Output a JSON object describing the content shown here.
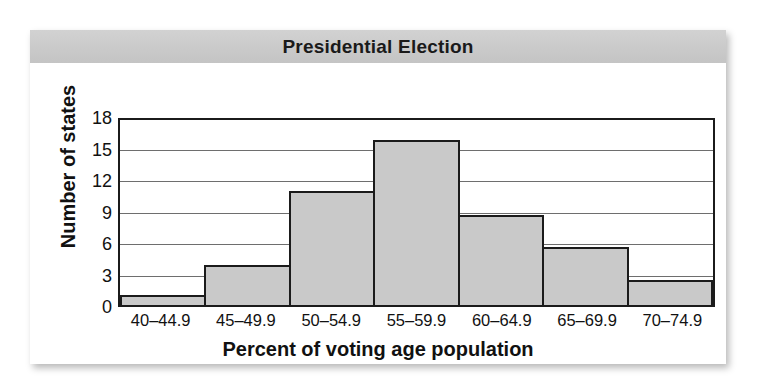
{
  "figure": {
    "title": "Presidential Election",
    "background_color": "#ffffff",
    "title_band_color": "#cacaca",
    "bar_fill_color": "#c9c9c9",
    "bar_border_color": "#1b1b1b",
    "axis_color": "#1b1b1b",
    "gridline_color": "#6e6e6e"
  },
  "chart_data": {
    "type": "bar",
    "title": "Presidential Election",
    "xlabel": "Percent of voting age population",
    "ylabel": "Number of states",
    "categories": [
      "40–44.9",
      "45–49.9",
      "50–54.9",
      "55–59.9",
      "60–64.9",
      "65–69.9",
      "70–74.9"
    ],
    "values": [
      1,
      3.8,
      10.9,
      15.7,
      8.6,
      5.5,
      2.4
    ],
    "ylim": [
      0,
      18
    ],
    "yticks": [
      0,
      3,
      6,
      9,
      12,
      15,
      18
    ],
    "ytick_labels": [
      "0",
      "3",
      "6",
      "9",
      "12",
      "15",
      "18"
    ],
    "grid": true,
    "grid_axis": "y",
    "legend": false,
    "legend_position": "none",
    "bar_gap": 0
  }
}
